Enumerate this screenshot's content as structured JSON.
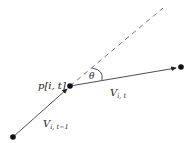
{
  "diagram": {
    "points": {
      "start": {
        "x": 13,
        "y": 137
      },
      "current": {
        "x": 70,
        "y": 86,
        "label": "p[i, t]"
      },
      "end": {
        "x": 181,
        "y": 67
      }
    },
    "vectors": {
      "previous": {
        "label_main": "V",
        "label_sub": "i, t−1"
      },
      "current": {
        "label_main": "V",
        "label_sub": "i, t"
      }
    },
    "angle": {
      "label": "θ"
    },
    "colors": {
      "line": "#222222",
      "dashed": "#555555",
      "background": "#ffffff"
    }
  }
}
